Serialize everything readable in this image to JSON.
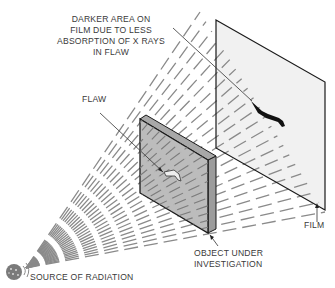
{
  "diagram": {
    "type": "radiography-schematic",
    "labels": {
      "film_note": [
        "DARKER AREA ON",
        "FILM DUE TO LESS",
        "ABSORPTION OF X RAYS",
        "IN FLAW"
      ],
      "flaw": "FLAW",
      "film": "FILM",
      "object": [
        "OBJECT UNDER",
        "INVESTIGATION"
      ],
      "source": "SOURCE OF RADIATION"
    },
    "colors": {
      "ray": "#8a8a8a",
      "outline": "#1a1a1a",
      "slab_face": "#b8b8b8",
      "slab_side": "#9c9c9c",
      "film_face": "#f1f1f1",
      "source": "#7a7a7a",
      "dark_spot": "#111111"
    }
  }
}
